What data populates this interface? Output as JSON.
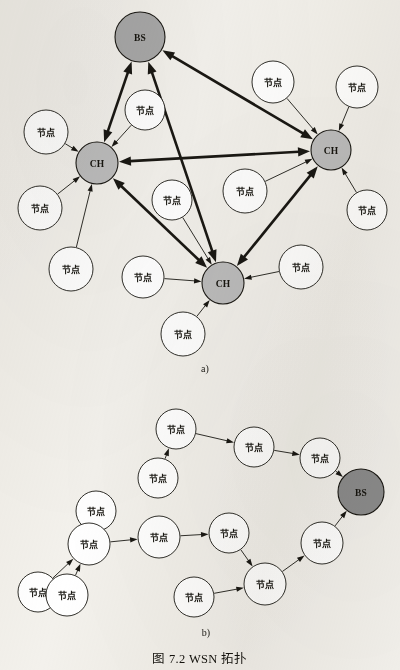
{
  "figure": {
    "caption": "图 7.2    WSN 拓扑",
    "panel_a_label": "a)",
    "panel_b_label": "b)",
    "background_color": "#f3f1ec",
    "stroke_color": "#1a1813",
    "cluster_head_fill": "#bdbdbd",
    "base_station_fill_a": "#a8a8a8",
    "base_station_fill_b": "#8c8c8c",
    "plain_node_fill": "#ffffff"
  },
  "labels": {
    "base_station": "BS",
    "cluster_head": "CH",
    "sensor_node": "节点"
  },
  "panel_a": {
    "name": "clustered-topology",
    "nodes": [
      {
        "id": "a-bs",
        "label": "BS",
        "kind": "base-station",
        "cx": 140,
        "cy": 37,
        "r": 25
      },
      {
        "id": "a-chL",
        "label": "CH",
        "kind": "cluster-head",
        "cx": 97,
        "cy": 163,
        "r": 21
      },
      {
        "id": "a-chR",
        "label": "CH",
        "kind": "cluster-head",
        "cx": 331,
        "cy": 150,
        "r": 20
      },
      {
        "id": "a-chB",
        "label": "CH",
        "kind": "cluster-head",
        "cx": 223,
        "cy": 283,
        "r": 21
      },
      {
        "id": "a-n1",
        "label": "节点",
        "kind": "sensor-node",
        "cx": 46,
        "cy": 132,
        "r": 22
      },
      {
        "id": "a-n2",
        "label": "节点",
        "kind": "sensor-node",
        "cx": 145,
        "cy": 110,
        "r": 20
      },
      {
        "id": "a-n3",
        "label": "节点",
        "kind": "sensor-node",
        "cx": 273,
        "cy": 82,
        "r": 21
      },
      {
        "id": "a-n4",
        "label": "节点",
        "kind": "sensor-node",
        "cx": 357,
        "cy": 87,
        "r": 21
      },
      {
        "id": "a-n5",
        "label": "节点",
        "kind": "sensor-node",
        "cx": 40,
        "cy": 208,
        "r": 22
      },
      {
        "id": "a-n6",
        "label": "节点",
        "kind": "sensor-node",
        "cx": 71,
        "cy": 269,
        "r": 22
      },
      {
        "id": "a-n7",
        "label": "节点",
        "kind": "sensor-node",
        "cx": 172,
        "cy": 200,
        "r": 20
      },
      {
        "id": "a-n8",
        "label": "节点",
        "kind": "sensor-node",
        "cx": 143,
        "cy": 277,
        "r": 21
      },
      {
        "id": "a-n9",
        "label": "节点",
        "kind": "sensor-node",
        "cx": 245,
        "cy": 191,
        "r": 22
      },
      {
        "id": "a-n10",
        "label": "节点",
        "kind": "sensor-node",
        "cx": 367,
        "cy": 210,
        "r": 20
      },
      {
        "id": "a-n11",
        "label": "节点",
        "kind": "sensor-node",
        "cx": 301,
        "cy": 267,
        "r": 22
      },
      {
        "id": "a-n12",
        "label": "节点",
        "kind": "sensor-node",
        "cx": 183,
        "cy": 334,
        "r": 22
      }
    ],
    "thick_links": [
      {
        "from": "a-chL",
        "to": "a-bs",
        "bidirectional": true
      },
      {
        "from": "a-chB",
        "to": "a-bs",
        "bidirectional": true
      },
      {
        "from": "a-chR",
        "to": "a-bs",
        "bidirectional": true
      },
      {
        "from": "a-chR",
        "to": "a-chL",
        "bidirectional": true
      },
      {
        "from": "a-chL",
        "to": "a-chB",
        "bidirectional": true
      },
      {
        "from": "a-chB",
        "to": "a-chR",
        "bidirectional": true
      }
    ],
    "thin_links": [
      {
        "from": "a-n1",
        "to": "a-chL"
      },
      {
        "from": "a-n2",
        "to": "a-chL"
      },
      {
        "from": "a-n5",
        "to": "a-chL"
      },
      {
        "from": "a-n6",
        "to": "a-chL"
      },
      {
        "from": "a-n3",
        "to": "a-chR"
      },
      {
        "from": "a-n4",
        "to": "a-chR"
      },
      {
        "from": "a-n9",
        "to": "a-chR"
      },
      {
        "from": "a-n10",
        "to": "a-chR"
      },
      {
        "from": "a-n7",
        "to": "a-chB"
      },
      {
        "from": "a-n8",
        "to": "a-chB"
      },
      {
        "from": "a-n11",
        "to": "a-chB"
      },
      {
        "from": "a-n12",
        "to": "a-chB"
      }
    ]
  },
  "panel_b": {
    "name": "multihop-topology",
    "nodes": [
      {
        "id": "b-bs",
        "label": "BS",
        "kind": "base-station",
        "cx": 361,
        "cy": 492,
        "r": 23
      },
      {
        "id": "b-n1",
        "label": "节点",
        "kind": "sensor-node",
        "cx": 176,
        "cy": 429,
        "r": 20
      },
      {
        "id": "b-n2",
        "label": "节点",
        "kind": "sensor-node",
        "cx": 254,
        "cy": 447,
        "r": 20
      },
      {
        "id": "b-n3",
        "label": "节点",
        "kind": "sensor-node",
        "cx": 320,
        "cy": 458,
        "r": 20
      },
      {
        "id": "b-n4",
        "label": "节点",
        "kind": "sensor-node",
        "cx": 158,
        "cy": 478,
        "r": 20
      },
      {
        "id": "b-n5",
        "label": "节点",
        "kind": "sensor-node",
        "cx": 96,
        "cy": 511,
        "r": 20
      },
      {
        "id": "b-n6",
        "label": "节点",
        "kind": "sensor-node",
        "cx": 38,
        "cy": 592,
        "r": 20
      },
      {
        "id": "b-n7",
        "label": "节点",
        "kind": "sensor-node",
        "cx": 89,
        "cy": 544,
        "r": 21
      },
      {
        "id": "b-n8",
        "label": "节点",
        "kind": "sensor-node",
        "cx": 159,
        "cy": 537,
        "r": 21
      },
      {
        "id": "b-n9",
        "label": "节点",
        "kind": "sensor-node",
        "cx": 67,
        "cy": 595,
        "r": 21
      },
      {
        "id": "b-n10",
        "label": "节点",
        "kind": "sensor-node",
        "cx": 229,
        "cy": 533,
        "r": 20
      },
      {
        "id": "b-n11",
        "label": "节点",
        "kind": "sensor-node",
        "cx": 265,
        "cy": 584,
        "r": 21
      },
      {
        "id": "b-n12",
        "label": "节点",
        "kind": "sensor-node",
        "cx": 322,
        "cy": 543,
        "r": 21
      },
      {
        "id": "b-n13",
        "label": "节点",
        "kind": "sensor-node",
        "cx": 194,
        "cy": 597,
        "r": 20
      }
    ],
    "links": [
      {
        "from": "b-n1",
        "to": "b-n2"
      },
      {
        "from": "b-n2",
        "to": "b-n3"
      },
      {
        "from": "b-n3",
        "to": "b-bs"
      },
      {
        "from": "b-n4",
        "to": "b-n1"
      },
      {
        "from": "b-n5",
        "to": "b-n7"
      },
      {
        "from": "b-n6",
        "to": "b-n7"
      },
      {
        "from": "b-n9",
        "to": "b-n7"
      },
      {
        "from": "b-n7",
        "to": "b-n8"
      },
      {
        "from": "b-n8",
        "to": "b-n10"
      },
      {
        "from": "b-n10",
        "to": "b-n11"
      },
      {
        "from": "b-n13",
        "to": "b-n11"
      },
      {
        "from": "b-n11",
        "to": "b-n12"
      },
      {
        "from": "b-n12",
        "to": "b-bs"
      }
    ]
  }
}
